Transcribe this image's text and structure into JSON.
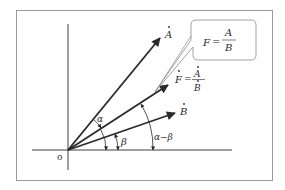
{
  "figure": {
    "type": "phasor-diagram",
    "colors": {
      "line": "#2a2a2a",
      "frame": "#9a9a9a",
      "background": "#ffffff"
    }
  },
  "labels": {
    "origin": "o",
    "vector_a": "A",
    "vector_b": "B",
    "vector_f": "F",
    "equals": "=",
    "alpha": "α",
    "beta": "β",
    "alpha_minus_beta": "α−β",
    "callout_lhs": "F",
    "callout_num": "A",
    "callout_den": "B",
    "f_eq_num": "A",
    "f_eq_den": "B"
  },
  "vectors": [
    {
      "name": "A",
      "angle_label": "α"
    },
    {
      "name": "F",
      "angle_label": "α−β",
      "expression": "F = A/B"
    },
    {
      "name": "B",
      "angle_label": "β"
    }
  ],
  "callout": {
    "text": "F = A/B"
  }
}
